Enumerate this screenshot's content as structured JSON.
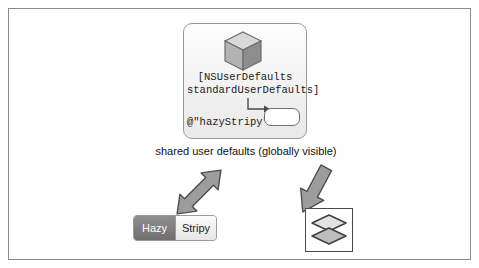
{
  "figure": {
    "caption": "shared user defaults (globally visible)",
    "defaults": {
      "code_line_1": "[NSUserDefaults",
      "code_line_2": "standardUserDefaults]",
      "key_literal": "@\"hazyStripy\"",
      "value_box_text": ""
    },
    "segmented_control": {
      "segments": [
        {
          "label": "Hazy",
          "selected": true
        },
        {
          "label": "Stripy",
          "selected": false
        }
      ]
    },
    "icons": {
      "cube": "cube-icon",
      "layers": "layers-icon",
      "arrow_left": "double-headed-arrow-icon",
      "arrow_right": "arrow-down-right-icon"
    },
    "colors": {
      "border": "#8c8c8c",
      "arrow_fill": "#9c9c9c",
      "arrow_stroke": "#5a5a5a",
      "segment_selected_bg": "#7d7d7d",
      "text": "#111111"
    }
  }
}
